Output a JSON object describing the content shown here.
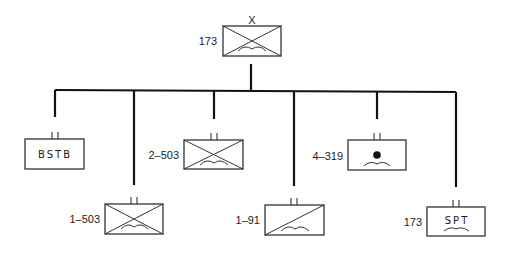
{
  "diagram": {
    "type": "military-unit-organization-chart",
    "colors": {
      "line": "#111111",
      "frame": "#333333",
      "background": "#ffffff"
    },
    "root": {
      "designation": "173",
      "echelon": "X",
      "symbol": "airborne-infantry"
    },
    "subordinates": [
      {
        "designation": "",
        "echelon": "II",
        "symbol": "brigade-special-troops",
        "text": "BSTB"
      },
      {
        "designation": "1–503",
        "echelon": "II",
        "symbol": "airborne-infantry"
      },
      {
        "designation": "2–503",
        "echelon": "II",
        "symbol": "airborne-infantry"
      },
      {
        "designation": "1–91",
        "echelon": "II",
        "symbol": "airborne-cavalry"
      },
      {
        "designation": "4–319",
        "echelon": "II",
        "symbol": "airborne-field-artillery"
      },
      {
        "designation": "173",
        "echelon": "II",
        "symbol": "airborne-support",
        "text": "SPT"
      }
    ]
  }
}
